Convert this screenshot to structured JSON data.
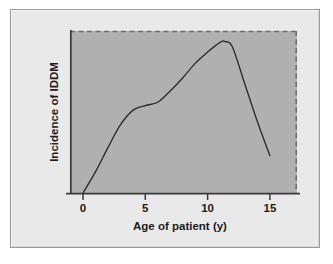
{
  "chart_data": {
    "type": "line",
    "title": "",
    "xlabel": "Age of patient (y)",
    "ylabel": "Incidence of IDDM",
    "xlim": [
      0,
      16.7
    ],
    "ylim": [
      0,
      1
    ],
    "xticks": [
      0,
      5,
      10,
      15
    ],
    "xtick_labels": [
      "0",
      "5",
      "10",
      "15"
    ],
    "yticks": [],
    "ytick_labels": [],
    "grid": false,
    "legend": null,
    "annotations": [],
    "series": [
      {
        "name": "Incidence of IDDM",
        "x": [
          0,
          1,
          2,
          3,
          4,
          5,
          6,
          7,
          8,
          9,
          10,
          11,
          11.4,
          12,
          13,
          14,
          15
        ],
        "values": [
          0.0,
          0.13,
          0.28,
          0.42,
          0.51,
          0.54,
          0.56,
          0.63,
          0.71,
          0.8,
          0.87,
          0.93,
          0.935,
          0.9,
          0.67,
          0.44,
          0.23
        ]
      }
    ]
  },
  "axis": {
    "x_tick_0": "0",
    "x_tick_1": "5",
    "x_tick_2": "10",
    "x_tick_3": "15",
    "x_title": "Age of patient (y)",
    "y_title": "Incidence of IDDM"
  },
  "style": {
    "page_background": "#ffffff",
    "card_background": "#e9e9e9",
    "card_border": "#9a9a9a",
    "plot_fill": "#b0b0b0",
    "axis_color": "#3a3a3a",
    "dashed_border_color": "#6e6e6e",
    "curve_color": "#2b2b2b",
    "text_color": "#1c1c1c"
  }
}
